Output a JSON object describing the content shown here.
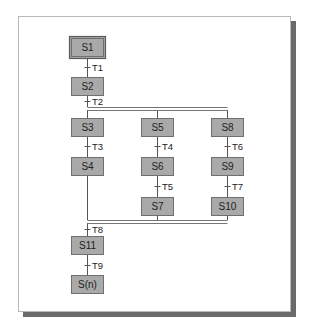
{
  "diagram": {
    "type": "sequential-function-chart",
    "steps": [
      {
        "id": "S1",
        "label": "S1",
        "initial": true
      },
      {
        "id": "S2",
        "label": "S2"
      },
      {
        "id": "S3",
        "label": "S3"
      },
      {
        "id": "S4",
        "label": "S4"
      },
      {
        "id": "S5",
        "label": "S5"
      },
      {
        "id": "S6",
        "label": "S6"
      },
      {
        "id": "S7",
        "label": "S7"
      },
      {
        "id": "S8",
        "label": "S8"
      },
      {
        "id": "S9",
        "label": "S9"
      },
      {
        "id": "S10",
        "label": "S10"
      },
      {
        "id": "S11",
        "label": "S11"
      },
      {
        "id": "Sn",
        "label": "S(n)"
      }
    ],
    "transitions": [
      {
        "id": "T1",
        "label": "T1",
        "from": "S1",
        "to": "S2"
      },
      {
        "id": "T2",
        "label": "T2",
        "from": "S2",
        "to": [
          "S3",
          "S5",
          "S8"
        ]
      },
      {
        "id": "T3",
        "label": "T3",
        "from": "S3",
        "to": "S4"
      },
      {
        "id": "T4",
        "label": "T4",
        "from": "S5",
        "to": "S6"
      },
      {
        "id": "T5",
        "label": "T5",
        "from": "S6",
        "to": "S7"
      },
      {
        "id": "T6",
        "label": "T6",
        "from": "S8",
        "to": "S9"
      },
      {
        "id": "T7",
        "label": "T7",
        "from": "S9",
        "to": "S10"
      },
      {
        "id": "T8",
        "label": "T8",
        "from": [
          "S4",
          "S7",
          "S10"
        ],
        "to": "S11"
      },
      {
        "id": "T9",
        "label": "T9",
        "from": "S11",
        "to": "Sn"
      }
    ],
    "branches": {
      "divergence": {
        "type": "simultaneous",
        "after": "T2",
        "to": [
          "S3",
          "S5",
          "S8"
        ]
      },
      "convergence": {
        "type": "simultaneous",
        "from": [
          "S4",
          "S7",
          "S10"
        ],
        "before": "T8"
      }
    },
    "colors": {
      "step_fill": "#a9a9a9",
      "step_border": "#6f6f6f",
      "shadow": "#6a6a6a",
      "frame_border": "#b8b8b8"
    }
  }
}
